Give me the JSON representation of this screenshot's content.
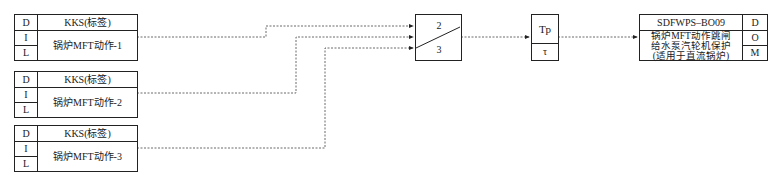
{
  "inputs": [
    {
      "tag": "KKS(标签)",
      "label": "锅炉MFT动作-1",
      "rows": [
        "D",
        "I",
        "L"
      ]
    },
    {
      "tag": "KKS(标签)",
      "label": "锅炉MFT动作-2",
      "rows": [
        "D",
        "I",
        "L"
      ]
    },
    {
      "tag": "KKS(标签)",
      "label": "锅炉MFT动作-3",
      "rows": [
        "D",
        "I",
        "L"
      ]
    }
  ],
  "voter": {
    "top": "2",
    "bottom": "3"
  },
  "timer": {
    "top": "Tp",
    "bottom": "τ"
  },
  "output": {
    "tag": "SDFWPS–BO09",
    "line1": "锅炉MFT动作跳闸",
    "line2": "给水泵汽轮机保护",
    "line3": "(适用于直流锅炉)",
    "rows": [
      "D",
      "O",
      "M"
    ]
  },
  "colors": {
    "line": "#222222",
    "wire": "#444444"
  }
}
